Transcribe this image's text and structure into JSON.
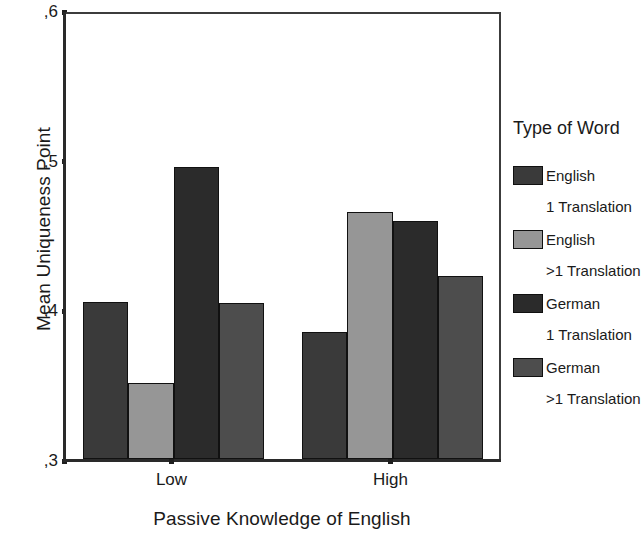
{
  "chart_data": {
    "type": "bar",
    "title": "",
    "xlabel": "Passive Knowledge of English",
    "ylabel": "Mean Uniqueness Point",
    "categories": [
      "Low",
      "High"
    ],
    "ylim": [
      0.3,
      0.6
    ],
    "yticks": [
      ",6",
      ",5",
      ",4",
      ",3"
    ],
    "ytick_values": [
      0.6,
      0.5,
      0.4,
      0.3
    ],
    "grid": false,
    "legend_position": "right",
    "legend_title": "Type of Word",
    "series": [
      {
        "name": "English",
        "subname": "1 Translation",
        "color": "#3a3a3a",
        "values": [
          0.405,
          0.385
        ]
      },
      {
        "name": "English",
        "subname": ">1 Translation",
        "color": "#969696",
        "values": [
          0.351,
          0.465
        ]
      },
      {
        "name": "German",
        "subname": "1 Translation",
        "color": "#2b2b2b",
        "values": [
          0.495,
          0.459
        ]
      },
      {
        "name": "German",
        "subname": ">1 Translation",
        "color": "#4d4d4d",
        "values": [
          0.404,
          0.422
        ]
      }
    ]
  },
  "axes": {
    "y_title": "Mean Uniqueness Point",
    "x_title": "Passive Knowledge of English",
    "y_tick_labels": [
      ",6",
      ",5",
      ",4",
      ",3"
    ],
    "x_tick_labels": [
      "Low",
      "High"
    ]
  },
  "legend": {
    "title": "Type of Word",
    "entries": [
      {
        "label": "English",
        "sublabel": "1 Translation",
        "color": "#3a3a3a"
      },
      {
        "label": "English",
        "sublabel": ">1 Translation",
        "color": "#969696"
      },
      {
        "label": "German",
        "sublabel": "1 Translation",
        "color": "#2b2b2b"
      },
      {
        "label": "German",
        "sublabel": ">1 Translation",
        "color": "#4d4d4d"
      }
    ]
  },
  "colors": {
    "axis": "#2a2a2a",
    "frame": "#3c3c3c",
    "background": "#ffffff",
    "text": "#1a1a1a"
  }
}
